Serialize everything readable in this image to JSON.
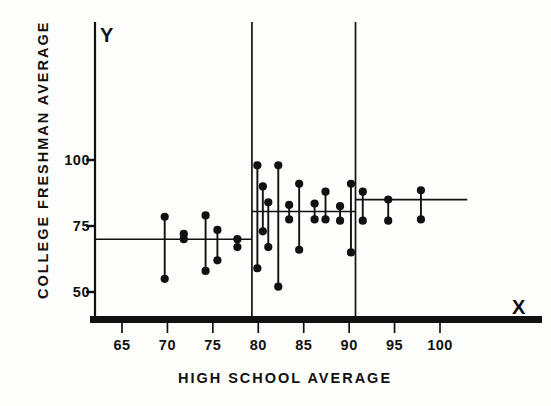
{
  "figure": {
    "background": "#fdfdfc",
    "ink": "#111111",
    "axis_marker_y": "Y",
    "axis_marker_x": "X"
  },
  "chart_data": {
    "type": "scatter",
    "title": "",
    "xlabel": "HIGH SCHOOL AVERAGE",
    "ylabel": "COLLEGE FRESHMAN AVERAGE",
    "xlim": [
      62,
      103
    ],
    "ylim": [
      38,
      118
    ],
    "xticks": [
      65,
      70,
      75,
      80,
      85,
      90,
      95,
      100
    ],
    "xticklabels": [
      "65",
      "70",
      "75",
      "80",
      "85",
      "90",
      "95",
      "100"
    ],
    "yticks": [
      50,
      75,
      100
    ],
    "yticklabels": [
      "50",
      "75",
      "100"
    ],
    "grid": false,
    "legend": null,
    "series": [
      {
        "name": "paired-ranges",
        "marker": "filled-circle",
        "connector": "vertical-line",
        "points": [
          {
            "x": 69.7,
            "y_high": 78.5,
            "y_low": 55.0
          },
          {
            "x": 71.8,
            "y_high": 72.0,
            "y_low": 70.0
          },
          {
            "x": 74.2,
            "y_high": 79.0,
            "y_low": 58.0
          },
          {
            "x": 75.5,
            "y_high": 73.5,
            "y_low": 62.0
          },
          {
            "x": 77.7,
            "y_high": 70.0,
            "y_low": 67.0
          },
          {
            "x": 79.9,
            "y_high": 98.0,
            "y_low": 59.0
          },
          {
            "x": 80.5,
            "y_high": 90.0,
            "y_low": 73.0
          },
          {
            "x": 81.1,
            "y_high": 84.0,
            "y_low": 67.0
          },
          {
            "x": 82.2,
            "y_high": 98.0,
            "y_low": 52.0
          },
          {
            "x": 83.4,
            "y_high": 83.0,
            "y_low": 77.5
          },
          {
            "x": 84.5,
            "y_high": 91.0,
            "y_low": 66.0
          },
          {
            "x": 86.2,
            "y_high": 83.5,
            "y_low": 77.5
          },
          {
            "x": 87.4,
            "y_high": 88.0,
            "y_low": 77.5
          },
          {
            "x": 89.0,
            "y_high": 82.5,
            "y_low": 77.0
          },
          {
            "x": 90.2,
            "y_high": 91.0,
            "y_low": 65.0
          },
          {
            "x": 91.5,
            "y_high": 88.0,
            "y_low": 77.0
          },
          {
            "x": 94.3,
            "y_high": 85.0,
            "y_low": 77.0
          },
          {
            "x": 97.9,
            "y_high": 88.5,
            "y_low": 77.5
          }
        ]
      }
    ],
    "group_levels": [
      {
        "name": "low-group-mean",
        "x_start": 62.0,
        "x_end": 79.3,
        "y": 70.0
      },
      {
        "name": "mid-group-mean",
        "x_start": 79.3,
        "x_end": 90.7,
        "y": 80.5
      },
      {
        "name": "high-group-mean",
        "x_start": 90.7,
        "x_end": 103.0,
        "y": 85.0
      }
    ],
    "dividers": [
      {
        "name": "divider-low-mid",
        "x": 79.3
      },
      {
        "name": "divider-mid-high",
        "x": 90.7
      }
    ]
  }
}
